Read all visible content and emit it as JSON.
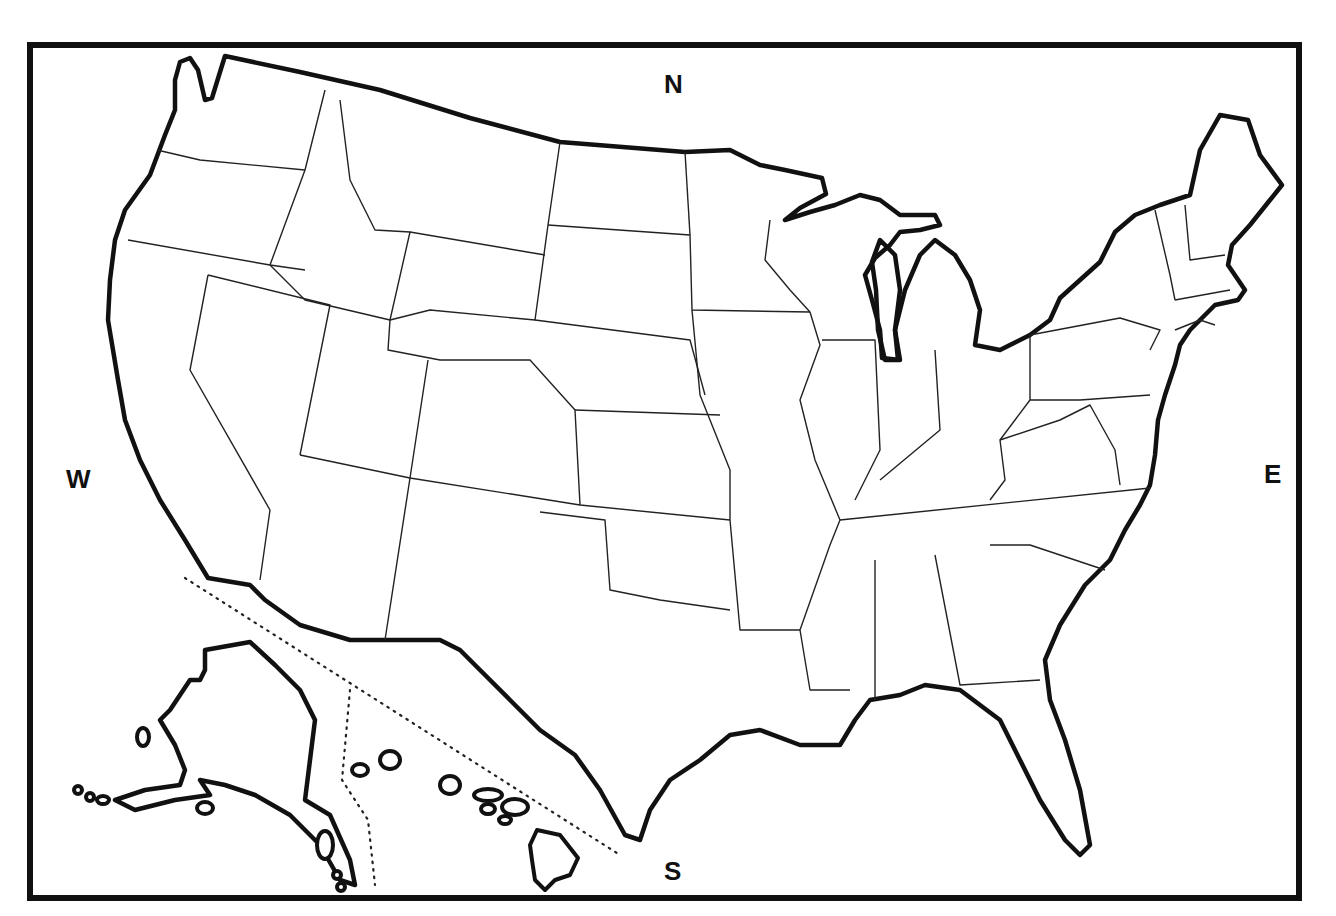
{
  "map": {
    "title": "",
    "type": "outline map of the United States",
    "compass": {
      "north": "N",
      "south": "S",
      "east": "E",
      "west": "W"
    },
    "insets": [
      "Alaska",
      "Hawaii"
    ],
    "colors": {
      "background": "#ffffff",
      "stroke": "#111111"
    }
  }
}
